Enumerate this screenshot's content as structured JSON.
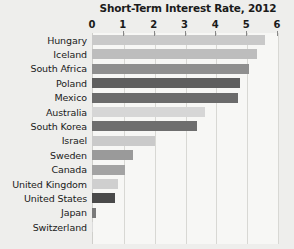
{
  "chart_data": {
    "type": "bar",
    "orientation": "horizontal",
    "title": "Short-Term Interest Rate, 2012",
    "xlabel": "",
    "ylabel": "",
    "xlim": [
      0,
      6
    ],
    "xticks": [
      0,
      1,
      2,
      3,
      4,
      5,
      6
    ],
    "xtick_labels": [
      "0",
      "1",
      "2",
      "3",
      "4",
      "5",
      "6"
    ],
    "grid": true,
    "legend": false,
    "categories": [
      "Hungary",
      "Iceland",
      "South Africa",
      "Poland",
      "Mexico",
      "Australia",
      "South Korea",
      "Israel",
      "Sweden",
      "Canada",
      "United Kingdom",
      "United States",
      "Japan",
      "Switzerland"
    ],
    "values": [
      5.6,
      5.35,
      5.1,
      4.8,
      4.75,
      3.65,
      3.4,
      2.05,
      1.33,
      1.07,
      0.85,
      0.75,
      0.12,
      0.04
    ],
    "bar_colors": [
      "#c9c9c9",
      "#bdbdbd",
      "#8f8f8f",
      "#5e5e5e",
      "#6b6b6b",
      "#d6d6d6",
      "#6e6e6e",
      "#cacaca",
      "#9a9a9a",
      "#a3a3a3",
      "#cfcfcf",
      "#4a4a4a",
      "#7a7a7a",
      "#dcdcdc"
    ]
  },
  "colors": {
    "page_background": "#eeeeec",
    "plot_background": "#f7f7f5",
    "gridline": "#d8d8d4",
    "axis_line": "#cfcfcb",
    "text": "#1a1a1a"
  }
}
